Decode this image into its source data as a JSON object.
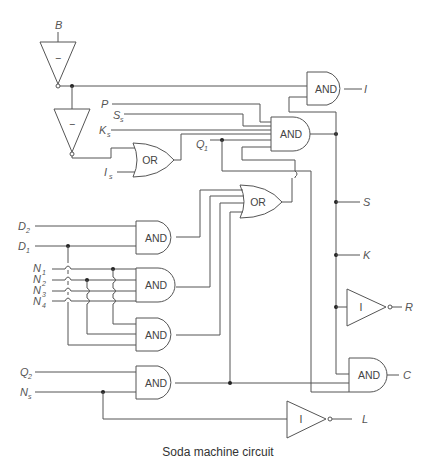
{
  "caption": "Soda machine circuit",
  "gates": {
    "inv_b": "−",
    "inv_b2": "−",
    "or_top": "OR",
    "and_i": "AND",
    "and_main": "AND",
    "or_mid": "OR",
    "and_d": "AND",
    "and_n": "AND",
    "and_n2": "AND",
    "and_q2": "AND",
    "inv_r": "I",
    "and_c": "AND",
    "inv_l": "I"
  },
  "inputs": {
    "B": "B",
    "P": "P",
    "Ss": {
      "main": "S",
      "sub": "s"
    },
    "Ks": {
      "main": "K",
      "sub": "s"
    },
    "Is": {
      "main": "I",
      "sub": "s"
    },
    "Q1": {
      "main": "Q",
      "sub": "1"
    },
    "D2": {
      "main": "D",
      "sub": "2"
    },
    "D1": {
      "main": "D",
      "sub": "1"
    },
    "N1": {
      "main": "N",
      "sub": "1"
    },
    "N2": {
      "main": "N",
      "sub": "2"
    },
    "N3": {
      "main": "N",
      "sub": "3"
    },
    "N4": {
      "main": "N",
      "sub": "4"
    },
    "Q2": {
      "main": "Q",
      "sub": "2"
    },
    "Ns": {
      "main": "N",
      "sub": "s"
    }
  },
  "outputs": {
    "I": "I",
    "S": "S",
    "K": "K",
    "R": "R",
    "C": "C",
    "L": "L"
  }
}
